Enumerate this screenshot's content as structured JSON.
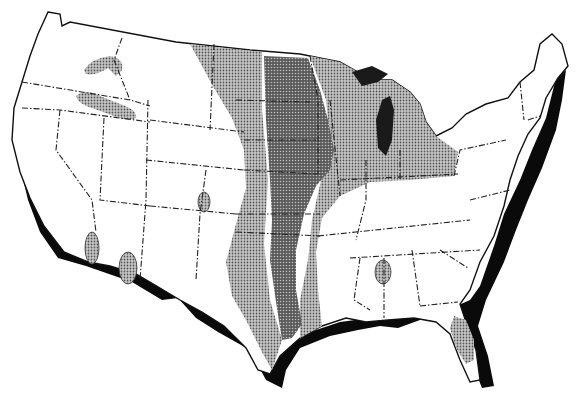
{
  "map": {
    "subject": "Contiguous United States",
    "style": "black-and-white stippled zone map",
    "legend_visible": false,
    "zones": [
      {
        "id": "zone-light",
        "shade": "light stipple",
        "color": "#9a9a9a",
        "regions": [
          "Great Plains west band (MT/WY/CO/NM/TX)",
          "Upper Midwest (MN/WI/MI/IA/IL/IN/OH)",
          "East Texas/Louisiana band",
          "Central Florida",
          "Idaho/Oregon patches",
          "Southern California patches",
          "Colorado spot",
          "Mississippi/Alabama spot"
        ]
      },
      {
        "id": "zone-dark",
        "shade": "dark stipple",
        "color": "#3e3e3e",
        "regions": [
          "Central corridor: ND/SD/NE/KS/OK/TX"
        ]
      }
    ],
    "colors": {
      "background": "#ffffff",
      "outline": "#111111",
      "coast_shadow": "#0a0a0a",
      "light_zone": "#9a9a9a",
      "dark_zone": "#3e3e3e"
    }
  }
}
